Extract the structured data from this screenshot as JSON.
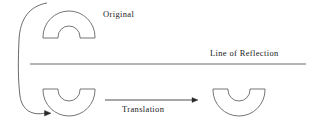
{
  "figure": {
    "type": "geometry-transformation-diagram",
    "width": 316,
    "height": 126,
    "background": "#ffffff",
    "stroke_color": "#4a4a4a",
    "text_color": "#1a1a1a"
  },
  "labels": {
    "original": "Original",
    "line_of_reflection": "Line of Reflection",
    "translation": "Translation"
  },
  "shapes": [
    {
      "name": "original-arch",
      "description": "semicircular annulus opening downward",
      "position": "top-left",
      "center_x": 69,
      "baseline_y": 38,
      "outer_radius": 26,
      "inner_radius": 11
    },
    {
      "name": "reflected-arch",
      "description": "semicircular annulus opening upward",
      "position": "bottom-left",
      "center_x": 69,
      "baseline_y": 89,
      "outer_radius": 26,
      "inner_radius": 11
    },
    {
      "name": "translated-arch",
      "description": "semicircular annulus opening upward",
      "position": "bottom-right",
      "center_x": 239,
      "baseline_y": 89,
      "outer_radius": 26,
      "inner_radius": 11
    }
  ],
  "lines": {
    "reflection_axis": {
      "x1": 30,
      "y1": 64,
      "x2": 306,
      "y2": 64
    },
    "translation_arrow": {
      "x1": 105,
      "y1": 100,
      "x2": 196,
      "y2": 100
    },
    "reflection_arc": {
      "start_x": 47,
      "start_y": 3,
      "end_x": 49,
      "end_y": 113
    }
  }
}
